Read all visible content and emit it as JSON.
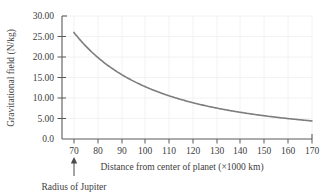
{
  "chart_data": {
    "type": "line",
    "title": "",
    "xlabel": "Distance from center of planet (×1000 km)",
    "ylabel": "Gravitational field (N/kg)",
    "xlim": [
      65,
      170
    ],
    "ylim": [
      0,
      30
    ],
    "grid": true,
    "legend": null,
    "xticks": [
      70,
      80,
      90,
      100,
      110,
      120,
      130,
      140,
      150,
      160,
      170
    ],
    "xticklabels": [
      "70",
      "80",
      "90",
      "100",
      "110",
      "120",
      "130",
      "140",
      "150",
      "160",
      "170"
    ],
    "yticks": [
      0,
      5,
      10,
      15,
      20,
      25,
      30
    ],
    "yticklabels": [
      "0.0",
      "5.00",
      "10.00",
      "15.00",
      "20.00",
      "25.00",
      "30.00"
    ],
    "series": [
      {
        "name": "Gravitational field",
        "color": "#7d7d7d",
        "x": [
          70,
          75,
          80,
          85,
          90,
          95,
          100,
          105,
          110,
          115,
          120,
          125,
          130,
          135,
          140,
          145,
          150,
          155,
          160,
          165,
          170
        ],
        "values": [
          26.0,
          22.65,
          19.91,
          17.63,
          15.73,
          14.12,
          12.74,
          11.55,
          10.53,
          9.63,
          8.85,
          8.15,
          7.54,
          6.99,
          6.5,
          6.06,
          5.66,
          5.3,
          4.98,
          4.68,
          4.41
        ]
      }
    ],
    "annotations": [
      {
        "name": "radius-of-jupiter",
        "text": "Radius of Jupiter",
        "x": 70,
        "arrow": "up"
      }
    ]
  },
  "axis": {
    "x_label": "Distance from center of planet (×1000 km)",
    "y_label": "Gravitational field (N/kg)",
    "x_tick_labels": [
      "70",
      "80",
      "90",
      "100",
      "110",
      "120",
      "130",
      "140",
      "150",
      "160",
      "170"
    ],
    "y_tick_labels": [
      "30.00",
      "25.00",
      "20.00",
      "15.00",
      "10.00",
      "5.00",
      "0.0"
    ]
  },
  "annotation": {
    "radius_label": "Radius of Jupiter"
  },
  "colors": {
    "curve": "#7d7d7d",
    "axis": "#4a4a4a",
    "grid": "#f0f0f0",
    "background": "#ffffff"
  }
}
